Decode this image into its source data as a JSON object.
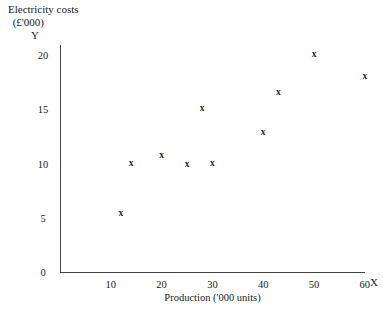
{
  "chart_data": {
    "type": "scatter",
    "title": "Electricity costs (£'000)",
    "title_line_1": "Electricity costs",
    "title_line_2": "(£'000)",
    "xlabel": "Production ('000 units)",
    "ylabel": "Electricity costs (£'000)",
    "x_axis_letter": "X",
    "y_axis_letter": "Y",
    "xlim": [
      0,
      62
    ],
    "ylim": [
      0,
      21.5
    ],
    "grid": false,
    "legend": null,
    "x_ticks": [
      {
        "value": 10,
        "label": "10"
      },
      {
        "value": 20,
        "label": "20"
      },
      {
        "value": 30,
        "label": "30"
      },
      {
        "value": 40,
        "label": "40"
      },
      {
        "value": 50,
        "label": "50"
      },
      {
        "value": 60,
        "label": "60"
      }
    ],
    "y_ticks": [
      {
        "value": 0,
        "label": "0"
      },
      {
        "value": 5,
        "label": "5"
      },
      {
        "value": 10,
        "label": "10"
      },
      {
        "value": 15,
        "label": "15"
      },
      {
        "value": 20,
        "label": "20"
      }
    ],
    "marker": "x",
    "marker_color": "#2a2a2a",
    "points": [
      {
        "x": 12,
        "y": 5.3,
        "label": "x"
      },
      {
        "x": 14,
        "y": 10.0,
        "label": "x"
      },
      {
        "x": 20,
        "y": 10.7,
        "label": "x"
      },
      {
        "x": 25,
        "y": 9.9,
        "label": "x"
      },
      {
        "x": 28,
        "y": 15.0,
        "label": "x"
      },
      {
        "x": 30,
        "y": 10.0,
        "label": "x"
      },
      {
        "x": 40,
        "y": 12.8,
        "label": "x"
      },
      {
        "x": 43,
        "y": 16.5,
        "label": "x"
      },
      {
        "x": 50,
        "y": 20.0,
        "label": "x"
      },
      {
        "x": 60,
        "y": 18.0,
        "label": "x"
      }
    ]
  },
  "axes_geometry": {
    "origin_x_px": 60,
    "origin_y_px": 272,
    "px_per_x_unit": 5.08,
    "px_per_y_unit": 10.85
  }
}
